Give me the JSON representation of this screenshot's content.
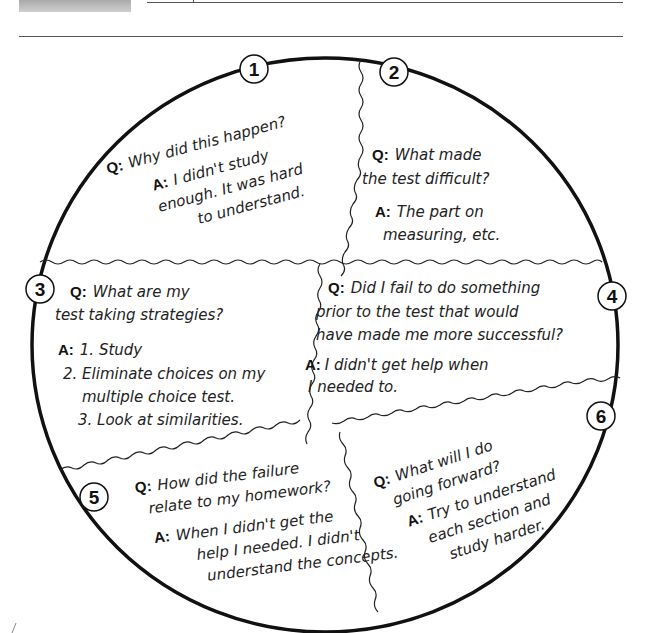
{
  "header": {
    "gray_block": "",
    "top_rule": "",
    "second_rule": ""
  },
  "circle": {
    "sections": [
      {
        "number": "1",
        "q_label": "Q:",
        "question": [
          "Why did this happen?"
        ],
        "a_label": "A:",
        "answer": [
          "I didn't study",
          "enough. It was hard",
          "to understand."
        ]
      },
      {
        "number": "2",
        "q_label": "Q:",
        "question": [
          "What made",
          "the test difficult?"
        ],
        "a_label": "A:",
        "answer": [
          "The part on",
          "measuring, etc."
        ]
      },
      {
        "number": "3",
        "q_label": "Q:",
        "question": [
          "What are my",
          "test taking strategies?"
        ],
        "a_label": "A:",
        "answer": [
          "1. Study",
          "2. Eliminate choices on my",
          "multiple choice test.",
          "3. Look at similarities."
        ]
      },
      {
        "number": "4",
        "q_label": "Q:",
        "question": [
          "Did I fail to do something",
          "prior to the test that would",
          "have made me more successful?"
        ],
        "a_label": "A:",
        "answer": [
          "I didn't get help when",
          "I needed to."
        ]
      },
      {
        "number": "5",
        "q_label": "Q:",
        "question": [
          "How did the failure",
          "relate to my homework?"
        ],
        "a_label": "A:",
        "answer": [
          "When I didn't get the",
          "help I needed. I didn't",
          "understand the concepts."
        ]
      },
      {
        "number": "6",
        "q_label": "Q:",
        "question": [
          "What will I do",
          "going forward?"
        ],
        "a_label": "A:",
        "answer": [
          "Try to understand",
          "each section and",
          "study harder."
        ]
      }
    ]
  }
}
